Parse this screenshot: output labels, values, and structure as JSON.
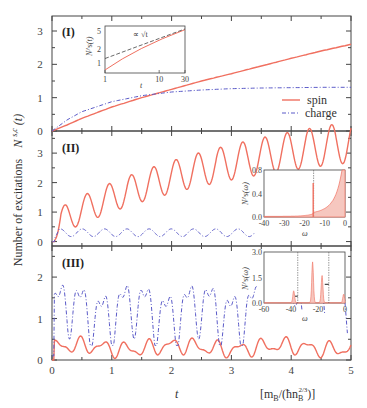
{
  "figure": {
    "ylabel": "Number of excitations  N^{s,c}(t)",
    "ylabel_main": "Number of excitations",
    "ylabel_sym": "N",
    "ylabel_sup": "s,c",
    "ylabel_arg": "(t)",
    "xlabel": "t",
    "xunit": "[m_B/(ħ n_B^{2/3})]",
    "xunit_a": "[m",
    "xunit_b": "B",
    "xunit_c": "/(ħn",
    "xunit_d": "B",
    "xunit_e": "2/3",
    "xunit_f": ")]",
    "colors": {
      "spin": "#f07060",
      "charge": "#5a5ac8",
      "axis": "#444444",
      "fill": "#f6c7bf",
      "vline": "#555555"
    }
  },
  "legend": {
    "spin": "spin",
    "charge": "charge"
  },
  "chart_data": [
    {
      "panel": "(I)",
      "type": "line",
      "xlabel": "t",
      "ylabel": "N^{s,c}(t)",
      "xlim": [
        0,
        5
      ],
      "ylim": [
        0,
        3.5
      ],
      "yticks": [
        0,
        1,
        2,
        3
      ],
      "xticks": [
        0,
        1,
        2,
        3,
        4,
        5
      ],
      "series": [
        {
          "name": "spin",
          "style": "solid",
          "x": [
            0,
            0.25,
            0.5,
            1,
            1.5,
            2,
            2.5,
            3,
            3.5,
            4,
            4.5,
            5
          ],
          "y": [
            0,
            0.18,
            0.38,
            0.72,
            1.0,
            1.25,
            1.5,
            1.72,
            1.95,
            2.18,
            2.4,
            2.6
          ]
        },
        {
          "name": "charge",
          "style": "dash-dot",
          "x": [
            0,
            0.25,
            0.5,
            1,
            1.5,
            2,
            2.5,
            3,
            3.5,
            4,
            4.5,
            5
          ],
          "y": [
            0,
            0.33,
            0.58,
            0.88,
            1.06,
            1.17,
            1.23,
            1.27,
            1.29,
            1.3,
            1.31,
            1.31
          ]
        }
      ],
      "inset": {
        "xlabel": "t",
        "ylabel": "N^s(t)",
        "xscale": "log",
        "yscale": "log",
        "xticks": [
          "1",
          "10",
          "30"
        ],
        "yticks": [
          "1",
          "2",
          "5"
        ],
        "annotation": "∝ √t",
        "series": [
          {
            "name": "spin",
            "style": "solid",
            "x": [
              1,
              3,
              10,
              30
            ],
            "y": [
              0.7,
              1.5,
              3.0,
              5.3
            ]
          },
          {
            "name": "√t fit",
            "style": "dashed",
            "x": [
              1,
              3,
              10,
              30
            ],
            "y": [
              1.3,
              2.2,
              3.3,
              5.5
            ]
          }
        ]
      }
    },
    {
      "panel": "(II)",
      "type": "line",
      "xlim": [
        0,
        5
      ],
      "ylim": [
        -0.2,
        3.7
      ],
      "yticks": [
        0,
        1,
        2,
        3
      ],
      "series": [
        {
          "name": "spin",
          "style": "solid",
          "description": "oscillating with period ~0.37, mean rising from ~0.6 to ~3.2, amplitude ~0.6",
          "peaks_t": [
            0.22,
            0.58,
            0.95,
            1.32,
            1.69,
            2.06,
            2.43,
            2.8,
            3.17,
            3.54,
            3.91,
            4.28,
            4.65
          ],
          "peaks_y": [
            1.0,
            1.45,
            1.75,
            2.0,
            2.25,
            2.45,
            2.65,
            2.8,
            2.95,
            3.1,
            3.25,
            3.35,
            3.45
          ]
        },
        {
          "name": "charge",
          "style": "dash-dot",
          "description": "small oscillation around 0.3 with amplitude ~0.15, visible until t≈3.4",
          "peaks_y": [
            0.5,
            0.45,
            0.45,
            0.42,
            0.4,
            0.4,
            0.4,
            0.4
          ]
        }
      ],
      "inset": {
        "xlabel": "ω",
        "ylabel": "N^s(ω)",
        "xlim": [
          -40,
          0
        ],
        "ylim": [
          0,
          0.8
        ],
        "xticks": [
          "-40",
          "-30",
          "-20",
          "-10",
          "0"
        ],
        "yticks": [
          "0.0",
          "0.4",
          "0.8"
        ],
        "vline": -15.5,
        "type": "filled spectrum with sharp peak at ω≈-15.5 (≈0.58) and rise near ω→0"
      }
    },
    {
      "panel": "(III)",
      "type": "line",
      "xlim": [
        0,
        5
      ],
      "ylim": [
        0,
        2.7
      ],
      "yticks": [
        0,
        1,
        2
      ],
      "series": [
        {
          "name": "spin",
          "style": "solid",
          "description": "irregular oscillations between ~0.05 and ~0.6"
        },
        {
          "name": "charge",
          "style": "dash-dot",
          "description": "irregular large oscillations between ~0.4 and ~2.3",
          "peaks_t": [
            0.25,
            0.58,
            0.92,
            1.02,
            1.35,
            1.7,
            2.05,
            2.5,
            2.85,
            2.98
          ],
          "peaks_y": [
            1.65,
            2.05,
            1.6,
            1.65,
            2.2,
            2.05,
            2.2,
            1.85,
            1.65,
            1.6
          ]
        }
      ],
      "inset": {
        "xlabel": "ω",
        "ylabel": "N^s(ω)",
        "xlim": [
          -60,
          0
        ],
        "ylim": [
          0,
          3.0
        ],
        "xticks": [
          "-60",
          "-40",
          "-20",
          "0"
        ],
        "yticks": [
          "0.0",
          "1.5",
          "3.0"
        ],
        "vlines": [
          -35,
          -12
        ],
        "peaks": [
          {
            "x": -38,
            "y": 0.7
          },
          {
            "x": -24,
            "y": 2.4
          },
          {
            "x": -17,
            "y": 1.6
          },
          {
            "x": -1,
            "y": 0.5
          }
        ]
      }
    }
  ],
  "labels": {
    "panel1": "(I)",
    "panel2": "(II)",
    "panel3": "(III)",
    "xticks": [
      "0",
      "1",
      "2",
      "3",
      "4",
      "5"
    ],
    "p1_yticks": [
      "0",
      "1",
      "2",
      "3"
    ],
    "p2_yticks": [
      "0",
      "1",
      "2",
      "3"
    ],
    "p3_yticks": [
      "0",
      "1",
      "2"
    ],
    "inset1": {
      "xt": [
        "1",
        "10",
        "30"
      ],
      "yt": [
        "1",
        "2",
        "5"
      ],
      "xl": "t",
      "yl": "N",
      "ann": "∝",
      "ann2": "√t"
    },
    "inset2": {
      "xt": [
        "-40",
        "-30",
        "-20",
        "-10",
        "0"
      ],
      "yt": [
        "0.0",
        "0.4",
        "0.8"
      ],
      "xl": "ω",
      "yl": "N"
    },
    "inset3": {
      "xt": [
        "-60",
        "-40",
        "-20",
        "0"
      ],
      "yt": [
        "0.0",
        "1.5",
        "3.0"
      ],
      "xl": "ω",
      "yl": "N"
    }
  }
}
